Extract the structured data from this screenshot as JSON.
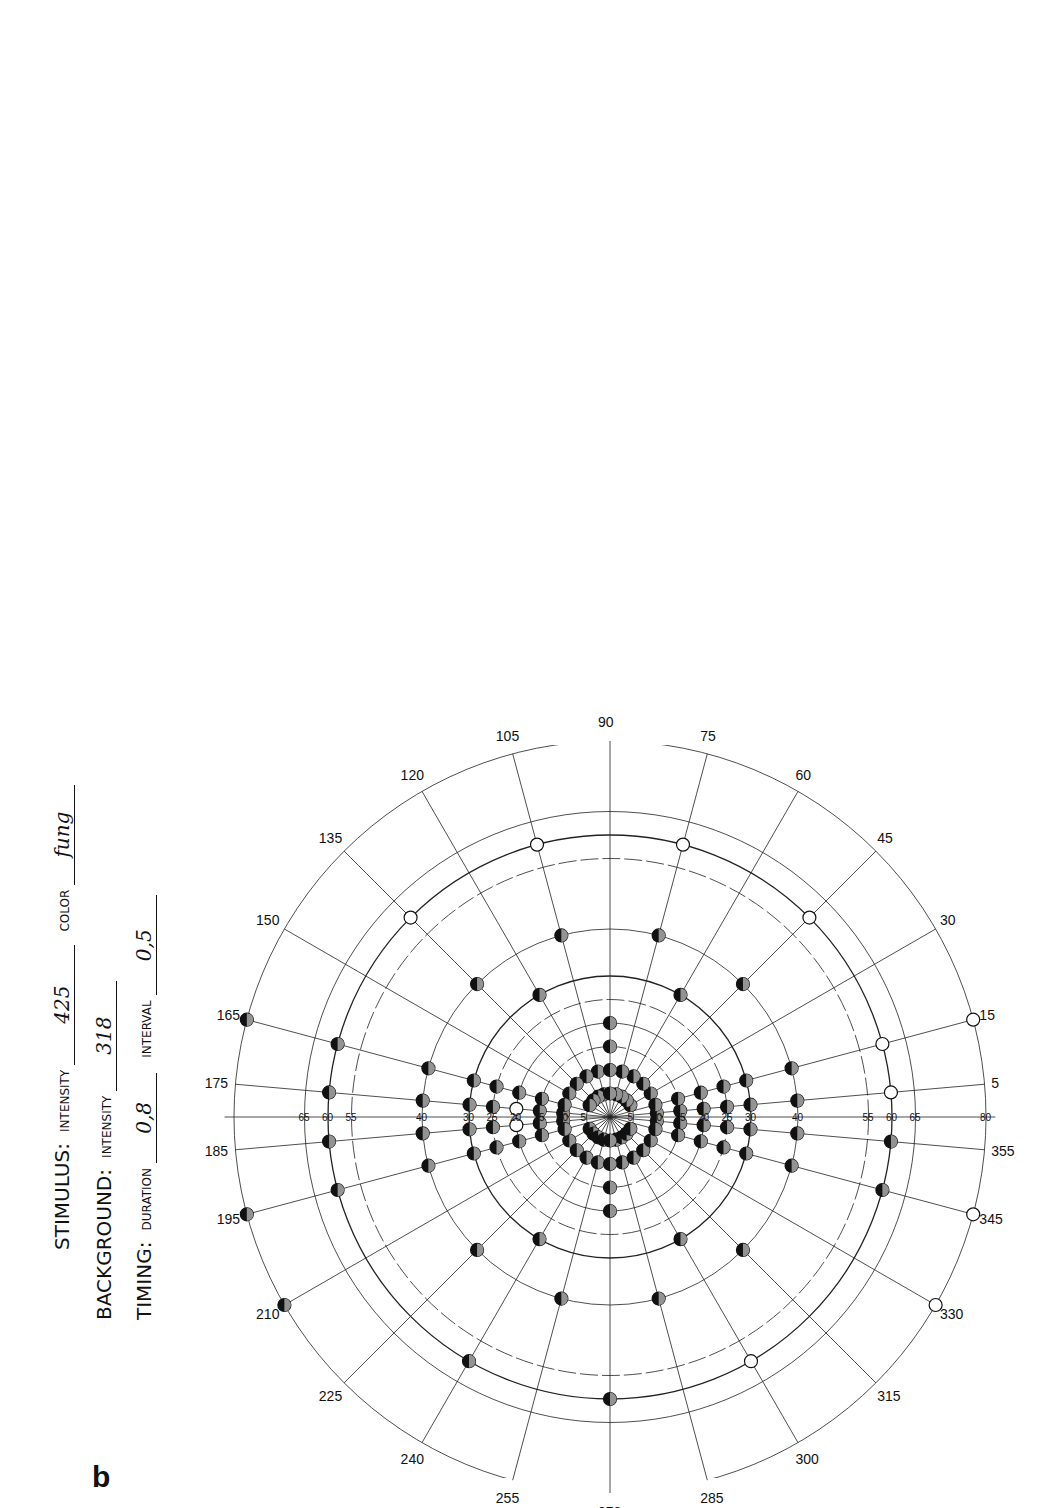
{
  "panel_a": {
    "label": "a",
    "type": "Goldmann kinetic perimetry chart",
    "angle_labels": [
      "0",
      "15",
      "30",
      "45",
      "60",
      "75",
      "90",
      "105",
      "120",
      "135",
      "150",
      "165",
      "180",
      "195",
      "210",
      "225",
      "240",
      "255",
      "270",
      "285",
      "300",
      "315",
      "330",
      "345"
    ],
    "radial_labels": [
      "10",
      "20",
      "30",
      "40",
      "50",
      "60",
      "70",
      "80",
      "90"
    ],
    "isopter_points_deg": [
      {
        "angle": 0,
        "ecc": 50
      },
      {
        "angle": 15,
        "ecc": 50
      },
      {
        "angle": 30,
        "ecc": 48
      },
      {
        "angle": 45,
        "ecc": 46
      },
      {
        "angle": 60,
        "ecc": 45
      },
      {
        "angle": 75,
        "ecc": 44
      },
      {
        "angle": 90,
        "ecc": 44
      },
      {
        "angle": 105,
        "ecc": 45
      },
      {
        "angle": 120,
        "ecc": 50
      },
      {
        "angle": 135,
        "ecc": 58
      },
      {
        "angle": 150,
        "ecc": 66
      },
      {
        "angle": 165,
        "ecc": 72
      },
      {
        "angle": 180,
        "ecc": 76
      },
      {
        "angle": 195,
        "ecc": 73
      },
      {
        "angle": 210,
        "ecc": 66
      },
      {
        "angle": 225,
        "ecc": 60
      },
      {
        "angle": 240,
        "ecc": 57
      },
      {
        "angle": 255,
        "ecc": 54
      },
      {
        "angle": 270,
        "ecc": 52
      },
      {
        "angle": 285,
        "ecc": 49
      },
      {
        "angle": 300,
        "ecc": 48
      },
      {
        "angle": 315,
        "ecc": 47
      },
      {
        "angle": 330,
        "ecc": 47
      },
      {
        "angle": 345,
        "ecc": 49
      }
    ],
    "blind_spot": {
      "angle_center": 180,
      "ecc_from": 10,
      "ecc_to": 20,
      "hatched": true
    },
    "object_table": {
      "title": "Object",
      "col_no": "No",
      "col_area": "mm²",
      "rows": [
        {
          "no": "O",
          "val": "1/16"
        },
        {
          "no": "I",
          "val": "1/4"
        },
        {
          "no": "II",
          "val": "1"
        },
        {
          "no": "III",
          "val": "4"
        },
        {
          "no": "IV",
          "val": "16"
        },
        {
          "no": "V",
          "val": "64"
        }
      ],
      "col_no2": "No",
      "col_rel": "Relat. Intens",
      "intensity_rows": [
        {
          "no": "1",
          "val": "0,0315"
        },
        {
          "no": "2",
          "val": "0,100"
        },
        {
          "no": "3",
          "val": "0,315"
        },
        {
          "no": "4",
          "val": "1,00"
        }
      ]
    },
    "pupil": {
      "value": "5",
      "unit": "mm",
      "label": "Diameter pupillae"
    },
    "color": {
      "options": "(W) R  G  B",
      "label": "Color"
    },
    "correctio": {
      "label": "Correctio",
      "value": "sc"
    },
    "relat_intens": {
      "title": "Relat. Intens.",
      "header": [
        "No",
        "4",
        "3",
        "2",
        "1"
      ],
      "rows": [
        "O",
        "I",
        "II",
        "III",
        "IV",
        "V"
      ],
      "mark": {
        "row": "I",
        "col": "4",
        "symbol": "X"
      },
      "side_label": "Object"
    },
    "swing_text": {
      "left": "Pour changer de côté faire passer l'index par ici",
      "center_1": "Fur Seitenwechsel",
      "center_2": "Zeiger hier durchfuhren",
      "right": "To change the side swing index along this line"
    },
    "visus_line": {
      "eye_selected": "(OS)",
      "eye_other": "OD.",
      "visus_label": "Visus:",
      "visus_value": "sc",
      "sph_label": "sph",
      "sph_value": "0",
      "cyl_label": "cyl",
      "axis_symbol": "°",
      "axis_value": "1.0"
    }
  },
  "panel_b": {
    "label": "b",
    "type": "Static perimetry chart",
    "angle_labels": [
      "5",
      "15",
      "30",
      "45",
      "60",
      "75",
      "90",
      "105",
      "120",
      "135",
      "150",
      "165",
      "175",
      "185",
      "195",
      "210",
      "225",
      "240",
      "255",
      "270",
      "285",
      "300",
      "315",
      "330",
      "345",
      "355"
    ],
    "horizontal_ticks_left": [
      "65",
      "60",
      "55",
      "40",
      "30",
      "25",
      "20",
      "15",
      "10",
      "5"
    ],
    "horizontal_ticks_right": [
      "5",
      "10",
      "15",
      "20",
      "25",
      "30",
      "40",
      "55",
      "60",
      "65",
      "80"
    ],
    "legend_points": "filled = seen (partially filled), open = not seen"
  },
  "form": {
    "stimulus_label": "STIMULUS:",
    "stimulus_intensity_label": "INTENSITY",
    "stimulus_intensity_value": "425",
    "color_label": "COLOR",
    "color_value": "fung",
    "background_label": "BACKGROUND:",
    "background_intensity_label": "INTENSITY",
    "background_intensity_value": "318",
    "timing_label": "TIMING:",
    "duration_label": "DURATION",
    "duration_value": "0,8",
    "interval_label": "INTERVAL",
    "interval_value": "0,5"
  }
}
